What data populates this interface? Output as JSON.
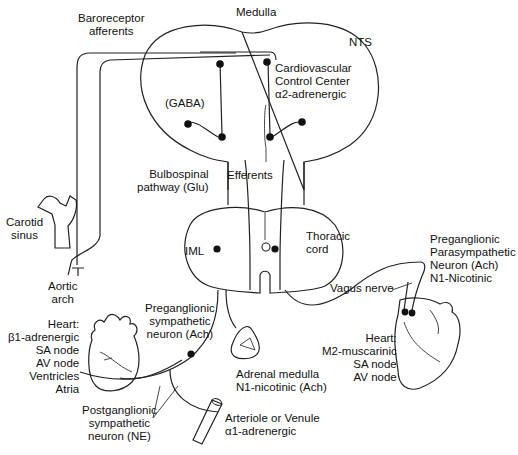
{
  "diagram": {
    "title_region": "Medulla",
    "labels": {
      "medulla": "Medulla",
      "baroreceptor": "Baroreceptor\nafferents",
      "nts": "NTS",
      "cv_center": "Cardiovascular\nControl Center\nα2-adrenergic",
      "gaba": "(GABA)",
      "bulbospinal": "Bulbospinal\npathway (Glu)",
      "efferents": "Efferents",
      "carotid": "Carotid\nsinus",
      "thoracic": "Thoracic\ncord",
      "iml": "IML",
      "preg_para": "Preganglionic\nParasympathetic\nNeuron (Ach)\nN1-Nicotinic",
      "vagus": "Vagus nerve",
      "aortic": "Aortic\narch",
      "heart_left": "Heart:\nβ1-adrenergic\nSA node\nAV node\nVentricles\nAtria",
      "preg_symp": "Preganglionic\nsympathetic\nneuron (Ach)",
      "heart_right": "Heart:\nM2-muscarinic\nSA node\nAV node",
      "adrenal": "Adrenal medulla\nN1-nicotinic (Ach)",
      "postgang": "Postganglionic\nsympathetic\nneuron (NE)",
      "arteriole": "Arteriole or Venule\nα1-adrenergic"
    }
  }
}
